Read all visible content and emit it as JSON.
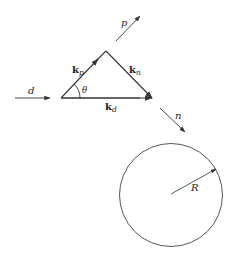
{
  "diagram": {
    "colors": {
      "stroke": "#333333",
      "background": "#ffffff"
    },
    "incoming_beam": {
      "label": "d"
    },
    "outgoing_proton": {
      "label": "p"
    },
    "outgoing_neutron": {
      "label": "n"
    },
    "triangle": {
      "kp": {
        "main": "k",
        "sub": "p"
      },
      "kn": {
        "main": "k",
        "sub": "n"
      },
      "kd": {
        "main": "k",
        "sub": "d"
      },
      "angle": "θ"
    },
    "target_circle": {
      "radius_label": "R"
    }
  }
}
